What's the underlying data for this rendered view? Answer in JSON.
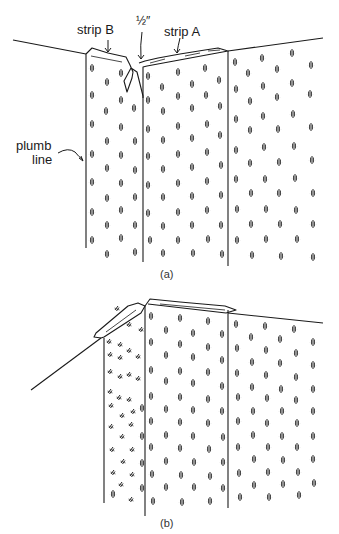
{
  "figure": {
    "panel_a": {
      "caption": "(a)",
      "labels": {
        "strip_b": "strip B",
        "half_inch": "½″",
        "strip_a": "strip A",
        "plumb_line_1": "plumb",
        "plumb_line_2": "line"
      }
    },
    "panel_b": {
      "caption": "(b)"
    }
  },
  "colors": {
    "ink": "#1a1a1a",
    "paper": "#ffffff"
  }
}
